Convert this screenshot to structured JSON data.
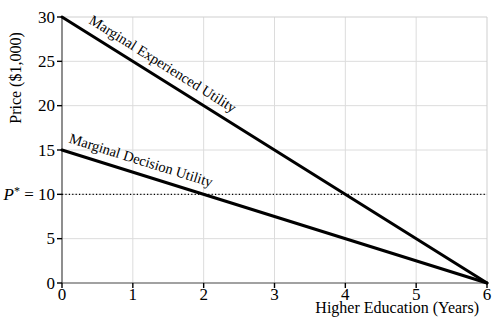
{
  "chart_data": {
    "type": "line",
    "title": "",
    "xlabel": "Higher Education (Years)",
    "ylabel": "Price ($1,000)",
    "xlim": [
      0,
      6
    ],
    "ylim": [
      0,
      30
    ],
    "xticks": [
      0,
      1,
      2,
      3,
      4,
      5,
      6
    ],
    "xtick_labels": [
      "0",
      "1",
      "2",
      "3",
      "4",
      "5",
      "6"
    ],
    "yticks": [
      0,
      5,
      10,
      15,
      20,
      25,
      30
    ],
    "ytick_labels": [
      "0",
      "5",
      "",
      "15",
      "20",
      "25",
      "30"
    ],
    "grid": true,
    "legend_position": "labels-on-lines",
    "series": [
      {
        "name": "Marginal Experienced Utility",
        "points": [
          [
            0,
            30
          ],
          [
            6,
            0
          ]
        ],
        "color": "#000000",
        "width": 3,
        "label_at_x": 0.3,
        "label_offset": 9
      },
      {
        "name": "Marginal Decision Utility",
        "points": [
          [
            0,
            15
          ],
          [
            6,
            0
          ]
        ],
        "color": "#000000",
        "width": 3,
        "label_at_x": 0.05,
        "label_offset": 9
      }
    ],
    "reference_line": {
      "y": 10,
      "style": "dotted",
      "color": "#000000",
      "label_var": "P",
      "label_sup": "*",
      "label_rest": " = 10"
    },
    "colors": {
      "grid": "#dcdcdc",
      "frame_light": "#cfcfcf",
      "axis": "#444444",
      "tick": "#000000",
      "text": "#000000",
      "background": "#ffffff"
    }
  }
}
